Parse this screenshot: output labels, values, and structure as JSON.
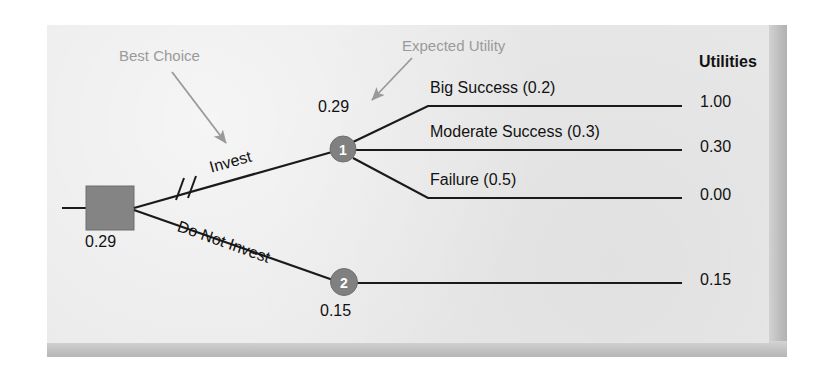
{
  "diagram": {
    "panel_color": "#e9e9e9",
    "node_color": "#808080",
    "annotation_color": "#9a9a9a",
    "line_color": "#1a1a1a"
  },
  "annotations": [
    {
      "id": "best-choice",
      "text": "Best Choice"
    },
    {
      "id": "expected-utility",
      "text": "Expected Utility"
    }
  ],
  "decision_node": {
    "shape": "square",
    "value": "0.29"
  },
  "branches": [
    {
      "id": "invest",
      "label": "Invest",
      "marked_best": true
    },
    {
      "id": "do-not-invest",
      "label": "Do Not Invest",
      "marked_best": false
    }
  ],
  "chance_nodes": [
    {
      "id": "node-1",
      "number": "1",
      "expected_utility": "0.29"
    },
    {
      "id": "node-2",
      "number": "2",
      "expected_utility": "0.15"
    }
  ],
  "outcomes": [
    {
      "id": "big-success",
      "label": "Big Success (0.2)",
      "probability": "0.2",
      "utility": "1.00",
      "parent": "node-1"
    },
    {
      "id": "moderate-success",
      "label": "Moderate Success (0.3)",
      "probability": "0.3",
      "utility": "0.30",
      "parent": "node-1"
    },
    {
      "id": "failure",
      "label": "Failure (0.5)",
      "probability": "0.5",
      "utility": "0.00",
      "parent": "node-1"
    },
    {
      "id": "no-invest-payoff",
      "label": "",
      "probability": "",
      "utility": "0.15",
      "parent": "node-2"
    }
  ],
  "utilities_header": "Utilities"
}
